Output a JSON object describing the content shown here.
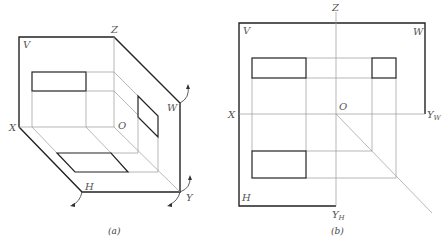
{
  "figure_a": {
    "caption": "(a)",
    "labels": {
      "V": "V",
      "Z": "Z",
      "W": "W",
      "X": "X",
      "O": "O",
      "H": "H",
      "Y": "Y"
    }
  },
  "figure_b": {
    "caption": "(b)",
    "labels": {
      "V": "V",
      "Z": "Z",
      "W": "W",
      "X": "X",
      "O": "O",
      "H": "H",
      "Yw": "Y",
      "Yw_sub": "W",
      "Yh": "Y",
      "Yh_sub": "H"
    }
  },
  "colors": {
    "outline": "#222222",
    "projection_line": "#999999",
    "label": "#555555"
  }
}
